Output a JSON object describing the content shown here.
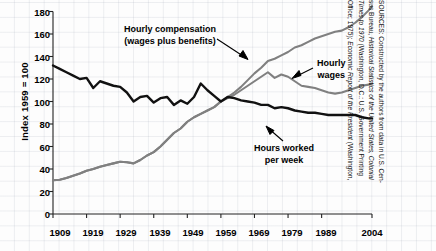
{
  "chart_data": {
    "type": "line",
    "title": "",
    "subtitle": "",
    "xlabel": "",
    "ylabel": "Index 1959 = 100",
    "xlim": [
      1909,
      2004
    ],
    "ylim": [
      0,
      180
    ],
    "grid": true,
    "legend_position": "inline-annotations",
    "yticks": [
      0,
      20,
      40,
      60,
      80,
      100,
      120,
      140,
      160,
      180
    ],
    "xticks": [
      1909,
      1919,
      1929,
      1939,
      1949,
      1959,
      1969,
      1979,
      1989,
      2004
    ],
    "xtick_labels": [
      "1909",
      "1919",
      "1929",
      "1939",
      "1949",
      "1959",
      "1969",
      "1979",
      "1989",
      "2004"
    ],
    "ytick_labels": [
      "0",
      "20",
      "40",
      "60",
      "80",
      "100",
      "120",
      "140",
      "160",
      "180"
    ],
    "annotations": [
      {
        "name": "hourly-compensation",
        "text_line1": "Hourly compensation",
        "text_line2": "(wages plus benefits)",
        "color": "#7a7a7a"
      },
      {
        "name": "hourly-wages",
        "text_line1": "Hourly",
        "text_line2": "wages",
        "color": "#7a7a7a"
      },
      {
        "name": "hours-worked",
        "text_line1": "Hours worked",
        "text_line2": "per week",
        "color": "#111111"
      }
    ],
    "series": [
      {
        "name": "Hourly compensation (wages plus benefits)",
        "color": "#808080",
        "x": [
          1909,
          1911,
          1913,
          1915,
          1917,
          1919,
          1921,
          1923,
          1925,
          1927,
          1929,
          1931,
          1933,
          1935,
          1937,
          1939,
          1941,
          1943,
          1945,
          1947,
          1949,
          1951,
          1953,
          1955,
          1957,
          1959,
          1961,
          1963,
          1965,
          1967,
          1969,
          1971,
          1973,
          1975,
          1977,
          1979,
          1981,
          1983,
          1985,
          1987,
          1989,
          1991,
          1993,
          1995,
          1997,
          1999,
          2001,
          2003,
          2004
        ],
        "values": [
          30,
          30.5,
          32,
          34,
          36,
          38.5,
          40,
          42,
          43.5,
          45,
          46.5,
          46,
          45,
          48,
          52,
          55,
          60,
          66,
          72,
          76,
          82,
          86,
          89,
          92,
          95,
          100,
          104,
          108,
          113,
          119,
          125,
          130,
          136,
          138,
          141,
          144,
          148,
          150,
          153,
          156,
          158,
          160,
          162,
          163,
          166,
          170,
          175,
          181,
          185
        ]
      },
      {
        "name": "Hourly wages",
        "color": "#808080",
        "x": [
          1909,
          1911,
          1913,
          1915,
          1917,
          1919,
          1921,
          1923,
          1925,
          1927,
          1929,
          1931,
          1933,
          1935,
          1937,
          1939,
          1941,
          1943,
          1945,
          1947,
          1949,
          1951,
          1953,
          1955,
          1957,
          1959,
          1961,
          1963,
          1965,
          1967,
          1969,
          1971,
          1973,
          1975,
          1977,
          1979,
          1981,
          1983,
          1985,
          1987,
          1989,
          1991,
          1993,
          1995,
          1997,
          1999,
          2001,
          2003,
          2004
        ],
        "values": [
          30,
          30.5,
          32,
          34,
          36,
          38.5,
          40,
          42,
          43.5,
          45,
          46.5,
          46,
          45,
          48,
          52,
          55,
          60,
          66,
          72,
          76,
          82,
          86,
          89,
          92,
          95,
          100,
          103,
          106,
          110,
          114,
          118,
          122,
          126,
          121,
          124,
          122,
          118,
          114,
          113,
          112,
          110,
          108,
          107,
          108,
          110,
          112,
          114,
          115,
          116
        ]
      },
      {
        "name": "Hours worked per week",
        "color": "#111111",
        "x": [
          1909,
          1911,
          1913,
          1915,
          1917,
          1919,
          1921,
          1923,
          1925,
          1927,
          1929,
          1931,
          1933,
          1935,
          1937,
          1939,
          1941,
          1943,
          1945,
          1947,
          1949,
          1951,
          1953,
          1955,
          1957,
          1959,
          1961,
          1963,
          1965,
          1967,
          1969,
          1971,
          1973,
          1975,
          1977,
          1979,
          1981,
          1983,
          1985,
          1987,
          1989,
          1991,
          1993,
          1995,
          1997,
          1999,
          2001,
          2003,
          2004
        ],
        "values": [
          132,
          129,
          126,
          123,
          120,
          121,
          112,
          118,
          116,
          114,
          113,
          108,
          100,
          104,
          105,
          99,
          103,
          104,
          97,
          101,
          98,
          104,
          116,
          110,
          105,
          100,
          104,
          103,
          101,
          100,
          99,
          97,
          97,
          94,
          95,
          94,
          92,
          91,
          90,
          90,
          89,
          88,
          88,
          88,
          88,
          88,
          86,
          85,
          85
        ]
      }
    ]
  },
  "source": {
    "lines": [
      "SOURCES: Constructed by the authors from data in U.S. Cen-",
      "sus Bureau, Historical Statistics of the United States, Colonial",
      "Times to 1970 (Washington, D.C.: U.S. Government Printing",
      "Office; 1975); Economic Report of the President (Washington,"
    ],
    "line2_plain": "sus Bureau, ",
    "line2_italic": "Historical Statistics of the United States, Colonial",
    "line3_italic": "Times to 1970",
    "line3_plain": " (Washington, D.C.: U.S. Government Printing",
    "line4_plain": "Office; 1975); ",
    "line4_italic": "Economic Report of the President",
    "line4_tail": " (Washington,"
  }
}
